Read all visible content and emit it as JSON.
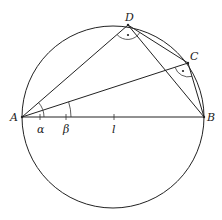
{
  "diagram": {
    "title": "",
    "points": {
      "A": {
        "label": "A",
        "x": 22,
        "y": 117
      },
      "B": {
        "label": "B",
        "x": 204,
        "y": 117
      },
      "C": {
        "label": "C",
        "x": 188,
        "y": 63
      },
      "D": {
        "label": "D",
        "x": 128,
        "y": 25
      }
    },
    "circle": {
      "cx": 113,
      "cy": 117,
      "r": 91
    },
    "segments": [
      [
        "A",
        "B"
      ],
      [
        "A",
        "D"
      ],
      [
        "A",
        "C"
      ],
      [
        "D",
        "B"
      ],
      [
        "D",
        "C"
      ],
      [
        "C",
        "B"
      ]
    ],
    "angle_labels": {
      "alpha": "α",
      "beta": "β",
      "l": "l"
    },
    "right_angle_markers": [
      "D",
      "C"
    ],
    "stroke_color": "#222222",
    "background": "#ffffff"
  }
}
